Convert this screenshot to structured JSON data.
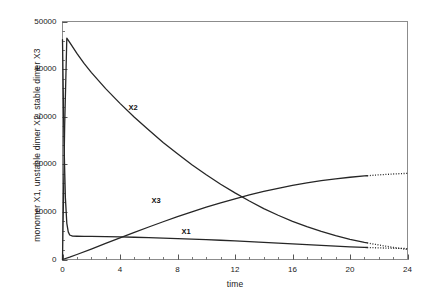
{
  "chart_data": {
    "type": "line",
    "title": "",
    "xlabel": "time",
    "ylabel": "monomer X1, unstable dimer X2, stable dimer X3",
    "xlim": [
      0,
      24
    ],
    "ylim": [
      0,
      50000
    ],
    "grid": false,
    "legend_position": "inline-curve-labels",
    "x_ticks": [
      {
        "value": 0,
        "label": "0"
      },
      {
        "value": 4,
        "label": "4"
      },
      {
        "value": 8,
        "label": "8"
      },
      {
        "value": 12,
        "label": "12"
      },
      {
        "value": 16,
        "label": "16"
      },
      {
        "value": 20,
        "label": "20"
      },
      {
        "value": 24,
        "label": "24"
      }
    ],
    "x_minor_tick_step": 1,
    "y_ticks": [
      {
        "value": 0,
        "label": "0"
      },
      {
        "value": 10000,
        "label": "10000"
      },
      {
        "value": 20000,
        "label": "20000"
      },
      {
        "value": 30000,
        "label": "30000"
      },
      {
        "value": 40000,
        "label": "40000"
      },
      {
        "value": 50000,
        "label": "50000"
      }
    ],
    "y_minor_tick_step": 2000,
    "annotations": [
      {
        "text": "X2",
        "x": 5.0,
        "y": 31800
      },
      {
        "text": "X3",
        "x": 6.6,
        "y": 12300
      },
      {
        "text": "X1",
        "x": 8.7,
        "y": 5700
      }
    ],
    "series": [
      {
        "name": "X1",
        "label": "monomer X1",
        "color": "#262626",
        "dashed_from_x": 21.2,
        "x": [
          0,
          0.1,
          0.2,
          0.3,
          0.4,
          0.5,
          0.7,
          1,
          1.5,
          2,
          3,
          4,
          5,
          6,
          7,
          8,
          9,
          10,
          11,
          12,
          13,
          14,
          15,
          16,
          17,
          18,
          19,
          20,
          21,
          22,
          23,
          24
        ],
        "values": [
          46200,
          25000,
          13000,
          7600,
          5800,
          5150,
          4900,
          4880,
          4870,
          4850,
          4800,
          4740,
          4670,
          4590,
          4500,
          4400,
          4290,
          4170,
          4040,
          3900,
          3750,
          3590,
          3430,
          3270,
          3110,
          2950,
          2800,
          2660,
          2540,
          2440,
          2360,
          2300
        ]
      },
      {
        "name": "X2",
        "label": "unstable dimer X2",
        "color": "#262626",
        "dashed_from_x": 21.2,
        "x": [
          0,
          0.15,
          0.3,
          0.5,
          1,
          1.5,
          2,
          3,
          4,
          5,
          6,
          7,
          8,
          9,
          10,
          11,
          12,
          13,
          14,
          15,
          16,
          17,
          18,
          19,
          20,
          21,
          22,
          23,
          24
        ],
        "values": [
          0,
          28000,
          46500,
          45600,
          43300,
          41200,
          39300,
          35900,
          32800,
          29900,
          27200,
          24600,
          22200,
          19900,
          17800,
          15800,
          14000,
          12300,
          10700,
          9300,
          8000,
          6900,
          5900,
          5000,
          4250,
          3600,
          3050,
          2550,
          2100
        ]
      },
      {
        "name": "X3",
        "label": "stable dimer X3",
        "color": "#262626",
        "dashed_from_x": 21.2,
        "x": [
          0,
          0.5,
          1,
          2,
          3,
          4,
          5,
          6,
          7,
          8,
          9,
          10,
          11,
          12,
          13,
          14,
          15,
          16,
          17,
          18,
          19,
          20,
          21,
          22,
          23,
          24
        ],
        "values": [
          0,
          500,
          1050,
          2200,
          3380,
          4550,
          5700,
          6830,
          7930,
          9000,
          10020,
          10990,
          11900,
          12760,
          13560,
          14300,
          14960,
          15560,
          16090,
          16550,
          16950,
          17280,
          17550,
          17780,
          17960,
          18100
        ]
      }
    ]
  },
  "axes": {
    "frame_color": "#8c8c8c",
    "tick_color": "#555555"
  }
}
